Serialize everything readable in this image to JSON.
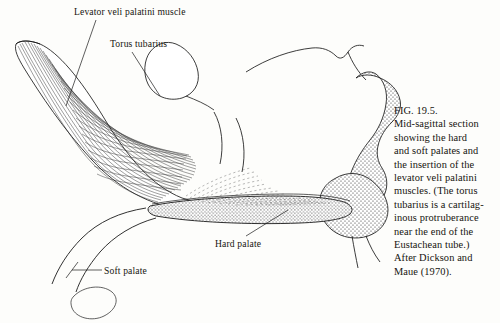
{
  "figure": {
    "id": "fig-19-5",
    "type": "anatomical-line-drawing",
    "view": "mid-sagittal section",
    "background_color": "#fdfdfb",
    "ink_color": "#1a1a1a"
  },
  "caption": {
    "lines": [
      "FIG. 19.5.",
      "Mid-sagittal section",
      "showing the hard",
      "and soft palates and",
      "the insertion of the",
      "levator veli palatini",
      "muscles. (The torus",
      "tubarius is a cartilag-",
      "inous protruberance",
      "near the end of the",
      "Eustachean tube.)",
      "After Dickson and",
      "Maue (1970)."
    ]
  },
  "annotations": [
    {
      "key": "levator",
      "label": "Levator veli palatini muscle"
    },
    {
      "key": "torus",
      "label": "Torus tubarius"
    },
    {
      "key": "soft",
      "label": "Soft palate"
    },
    {
      "key": "hard",
      "label": "Hard palate"
    }
  ]
}
